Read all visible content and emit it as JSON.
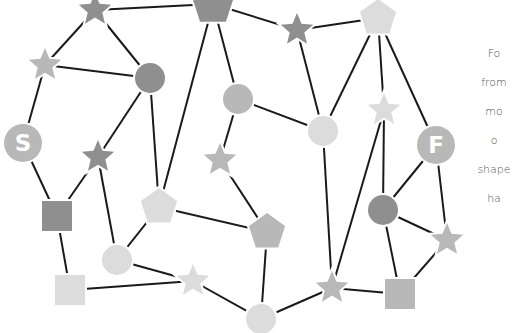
{
  "instructions": {
    "lines": [
      "Fo",
      "from",
      "mo",
      "o",
      "shape",
      "ha"
    ]
  },
  "colors": {
    "dark": "#8f8f8f",
    "mid": "#b8b8b8",
    "light": "#dcdcdc",
    "edge": "#1a1a1a",
    "label": "#ffffff"
  },
  "nodes": [
    {
      "id": "n1",
      "shape": "star",
      "tone": "dark",
      "x": 95,
      "y": 10,
      "r": 17
    },
    {
      "id": "n2",
      "shape": "pentagon",
      "tone": "dark",
      "x": 213,
      "y": 4,
      "r": 22
    },
    {
      "id": "n3",
      "shape": "star",
      "tone": "dark",
      "x": 297,
      "y": 30,
      "r": 17
    },
    {
      "id": "n4",
      "shape": "pentagon",
      "tone": "light",
      "x": 378,
      "y": 18,
      "r": 19
    },
    {
      "id": "n5",
      "shape": "star",
      "tone": "mid",
      "x": 45,
      "y": 65,
      "r": 17
    },
    {
      "id": "n6",
      "shape": "circle",
      "tone": "dark",
      "x": 150,
      "y": 78,
      "r": 15
    },
    {
      "id": "n7",
      "shape": "circle",
      "tone": "mid",
      "x": 238,
      "y": 99,
      "r": 15
    },
    {
      "id": "n8",
      "shape": "circle",
      "tone": "light",
      "x": 323,
      "y": 131,
      "r": 15
    },
    {
      "id": "n9",
      "shape": "star",
      "tone": "light",
      "x": 384,
      "y": 110,
      "r": 17
    },
    {
      "id": "start",
      "shape": "circle",
      "tone": "mid",
      "x": 23,
      "y": 143,
      "r": 19,
      "label": "S"
    },
    {
      "id": "finish",
      "shape": "circle",
      "tone": "mid",
      "x": 436,
      "y": 145,
      "r": 19,
      "label": "F"
    },
    {
      "id": "n10",
      "shape": "star",
      "tone": "dark",
      "x": 98,
      "y": 157,
      "r": 17
    },
    {
      "id": "n11",
      "shape": "star",
      "tone": "mid",
      "x": 220,
      "y": 160,
      "r": 17
    },
    {
      "id": "n12",
      "shape": "pentagon",
      "tone": "light",
      "x": 159,
      "y": 207,
      "r": 19
    },
    {
      "id": "n13",
      "shape": "circle",
      "tone": "dark",
      "x": 383,
      "y": 210,
      "r": 15
    },
    {
      "id": "n14",
      "shape": "square",
      "tone": "dark",
      "x": 57,
      "y": 216,
      "r": 15
    },
    {
      "id": "n15",
      "shape": "pentagon",
      "tone": "mid",
      "x": 267,
      "y": 232,
      "r": 19
    },
    {
      "id": "n16",
      "shape": "star",
      "tone": "mid",
      "x": 447,
      "y": 240,
      "r": 17
    },
    {
      "id": "n17",
      "shape": "circle",
      "tone": "light",
      "x": 117,
      "y": 260,
      "r": 15
    },
    {
      "id": "n18",
      "shape": "star",
      "tone": "light",
      "x": 193,
      "y": 281,
      "r": 17
    },
    {
      "id": "n19",
      "shape": "square",
      "tone": "light",
      "x": 70,
      "y": 290,
      "r": 15
    },
    {
      "id": "n20",
      "shape": "star",
      "tone": "mid",
      "x": 332,
      "y": 288,
      "r": 17
    },
    {
      "id": "n21",
      "shape": "square",
      "tone": "mid",
      "x": 400,
      "y": 294,
      "r": 15
    },
    {
      "id": "n22",
      "shape": "circle",
      "tone": "light",
      "x": 261,
      "y": 319,
      "r": 15
    }
  ],
  "edges": [
    [
      "n1",
      "n2"
    ],
    [
      "n1",
      "n5"
    ],
    [
      "n1",
      "n6"
    ],
    [
      "n5",
      "n6"
    ],
    [
      "n5",
      "start"
    ],
    [
      "n6",
      "n10"
    ],
    [
      "n6",
      "n12"
    ],
    [
      "n2",
      "n12"
    ],
    [
      "n2",
      "n7"
    ],
    [
      "n2",
      "n3"
    ],
    [
      "n3",
      "n4"
    ],
    [
      "n3",
      "n8"
    ],
    [
      "n4",
      "n8"
    ],
    [
      "n4",
      "n9"
    ],
    [
      "n4",
      "finish"
    ],
    [
      "n7",
      "n8"
    ],
    [
      "n7",
      "n11"
    ],
    [
      "start",
      "n14"
    ],
    [
      "n10",
      "n14"
    ],
    [
      "n10",
      "n17"
    ],
    [
      "n12",
      "n17"
    ],
    [
      "n12",
      "n15"
    ],
    [
      "n11",
      "n15"
    ],
    [
      "n15",
      "n22"
    ],
    [
      "n14",
      "n19"
    ],
    [
      "n17",
      "n18"
    ],
    [
      "n19",
      "n18"
    ],
    [
      "n18",
      "n22"
    ],
    [
      "n22",
      "n20"
    ],
    [
      "n8",
      "n20"
    ],
    [
      "n9",
      "n20"
    ],
    [
      "n9",
      "n13"
    ],
    [
      "finish",
      "n13"
    ],
    [
      "finish",
      "n16"
    ],
    [
      "n13",
      "n16"
    ],
    [
      "n13",
      "n21"
    ],
    [
      "n20",
      "n21"
    ],
    [
      "n16",
      "n21"
    ]
  ]
}
